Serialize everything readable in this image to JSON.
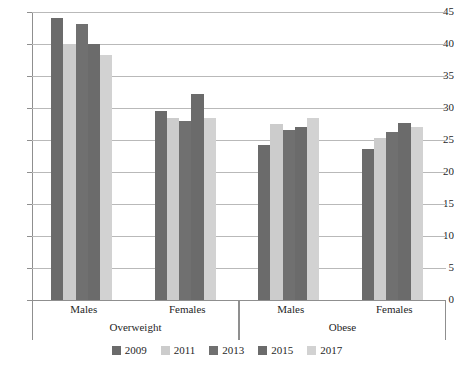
{
  "chart_data": {
    "type": "bar",
    "title": "",
    "subtitle": "",
    "xlabel": "",
    "ylabel": "",
    "ylim": [
      0,
      45
    ],
    "ytick_step": 5,
    "ytick_labels": [
      "45",
      "40",
      "35",
      "30",
      "25",
      "20",
      "15",
      "10",
      "5",
      "0"
    ],
    "grid": true,
    "legend_position": "bottom",
    "group_labels": [
      "Overweight",
      "Obese"
    ],
    "categories": [
      "Males",
      "Females",
      "Males",
      "Females"
    ],
    "category_groups": [
      {
        "group": "Overweight",
        "subcategories": [
          "Males",
          "Females"
        ]
      },
      {
        "group": "Obese",
        "subcategories": [
          "Males",
          "Females"
        ]
      }
    ],
    "series": [
      {
        "name": "2009",
        "color": "#6b6b6b",
        "values": [
          44.0,
          29.5,
          24.2,
          23.6
        ]
      },
      {
        "name": "2011",
        "color": "#cccccc",
        "values": [
          40.0,
          28.4,
          27.5,
          25.3
        ]
      },
      {
        "name": "2013",
        "color": "#707070",
        "values": [
          43.2,
          28.0,
          26.5,
          26.2
        ]
      },
      {
        "name": "2015",
        "color": "#6b6b6b",
        "values": [
          40.0,
          32.2,
          27.0,
          27.7
        ]
      },
      {
        "name": "2017",
        "color": "#d2d2d2",
        "values": [
          38.3,
          28.5,
          28.5,
          27.0
        ]
      }
    ]
  },
  "legend": {
    "items": [
      {
        "label": "2009",
        "color": "#6b6b6b"
      },
      {
        "label": "2011",
        "color": "#cccccc"
      },
      {
        "label": "2013",
        "color": "#707070"
      },
      {
        "label": "2015",
        "color": "#6b6b6b"
      },
      {
        "label": "2017",
        "color": "#d2d2d2"
      }
    ]
  },
  "axis": {
    "y_ticks": [
      "45",
      "40",
      "35",
      "30",
      "25",
      "20",
      "15",
      "10",
      "5",
      "0"
    ]
  }
}
